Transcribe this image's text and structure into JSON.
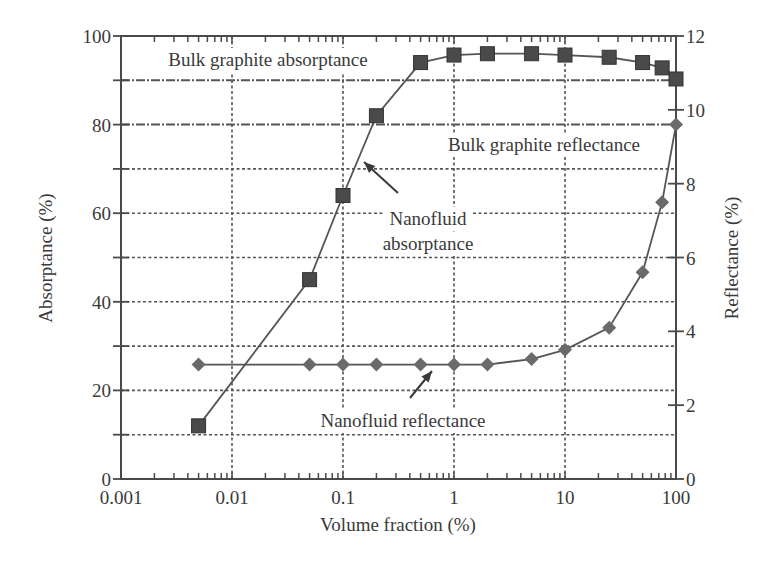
{
  "chart_data": {
    "type": "line",
    "title": "",
    "xlabel": "Volume fraction (%)",
    "ylabel": "Absorptance (%)",
    "y2label": "Reflectance (%)",
    "xscale": "log",
    "xlim": [
      0.001,
      100
    ],
    "ylim": [
      0,
      100
    ],
    "y2lim": [
      0,
      12
    ],
    "grid": true,
    "legend": "none (inline annotations)",
    "x_ticks": [
      {
        "value": 0.001,
        "label": "0.001"
      },
      {
        "value": 0.01,
        "label": "0.01"
      },
      {
        "value": 0.1,
        "label": "0.1"
      },
      {
        "value": 1,
        "label": "1"
      },
      {
        "value": 10,
        "label": "10"
      },
      {
        "value": 100,
        "label": "100"
      }
    ],
    "y_ticks": [
      {
        "value": 0,
        "label": "0"
      },
      {
        "value": 20,
        "label": "20"
      },
      {
        "value": 40,
        "label": "40"
      },
      {
        "value": 60,
        "label": "60"
      },
      {
        "value": 80,
        "label": "80"
      },
      {
        "value": 100,
        "label": "100"
      }
    ],
    "y2_ticks": [
      {
        "value": 0,
        "label": "0"
      },
      {
        "value": 2,
        "label": "2"
      },
      {
        "value": 4,
        "label": "4"
      },
      {
        "value": 6,
        "label": "6"
      },
      {
        "value": 8,
        "label": "8"
      },
      {
        "value": 10,
        "label": "10"
      },
      {
        "value": 12,
        "label": "12"
      }
    ],
    "series": [
      {
        "name": "Nanofluid absorptance",
        "axis": "left",
        "marker": "square",
        "x": [
          0.005,
          0.05,
          0.1,
          0.2,
          0.5,
          1,
          2,
          5,
          10,
          25,
          50,
          75,
          100
        ],
        "values": [
          12,
          45,
          64,
          82,
          94,
          95.7,
          96,
          96,
          95.7,
          95.2,
          94,
          92.8,
          90.3
        ]
      },
      {
        "name": "Nanofluid reflectance",
        "axis": "right",
        "marker": "diamond",
        "x": [
          0.005,
          0.05,
          0.1,
          0.2,
          0.5,
          1,
          2,
          5,
          10,
          25,
          50,
          75,
          100
        ],
        "values": [
          3.1,
          3.1,
          3.1,
          3.1,
          3.1,
          3.1,
          3.1,
          3.25,
          3.5,
          4.1,
          5.6,
          7.5,
          9.6
        ]
      }
    ],
    "reference_lines": [
      {
        "name": "Bulk graphite absorptance",
        "axis": "left",
        "value": 90
      },
      {
        "name": "Bulk graphite reflectance",
        "axis": "right",
        "value": 9.6
      }
    ],
    "annotations": [
      {
        "id": "bulk_abs",
        "text": "Bulk graphite absorptance",
        "x": 268,
        "y": 66,
        "anchor": "middle"
      },
      {
        "id": "bulk_ref",
        "text": "Bulk graphite reflectance",
        "x": 544,
        "y": 151,
        "anchor": "middle"
      },
      {
        "id": "nano_abs_1",
        "text": "Nanofluid",
        "x": 428,
        "y": 225,
        "anchor": "middle"
      },
      {
        "id": "nano_abs_2",
        "text": "absorptance",
        "x": 428,
        "y": 250,
        "anchor": "middle"
      },
      {
        "id": "nano_ref",
        "text": "Nanofluid reflectance",
        "x": 403,
        "y": 427,
        "anchor": "middle"
      }
    ],
    "arrows": [
      {
        "from": [
          398,
          193
        ],
        "to": [
          364,
          162
        ]
      },
      {
        "from": [
          410,
          398
        ],
        "to": [
          432,
          371
        ]
      }
    ],
    "colors": {
      "axis": "#4a4a4a",
      "grid": "#555555",
      "line": "#555555",
      "marker": "#4a4a4a",
      "reflectance_marker": "#6a6a6a",
      "text": "#3a3a3a"
    }
  }
}
